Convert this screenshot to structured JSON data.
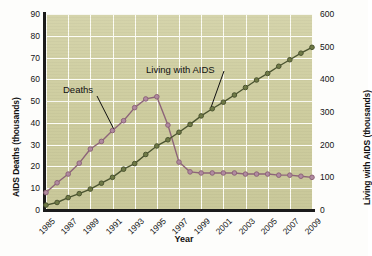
{
  "chart_data": {
    "type": "line",
    "title": "",
    "xlabel": "Year",
    "ylabel_left": "AIDS Deaths (thousands)",
    "ylabel_right": "Living with AIDS (thousands)",
    "x": [
      1985,
      1986,
      1987,
      1988,
      1989,
      1990,
      1991,
      1992,
      1993,
      1994,
      1995,
      1996,
      1997,
      1998,
      1999,
      2000,
      2001,
      2002,
      2003,
      2004,
      2005,
      2006,
      2007,
      2008,
      2009
    ],
    "xtick_labels": [
      "1985",
      "1987",
      "1989",
      "1991",
      "1993",
      "1995",
      "1997",
      "1999",
      "2001",
      "2003",
      "2005",
      "2007",
      "2009"
    ],
    "xtick_values": [
      1985,
      1987,
      1989,
      1991,
      1993,
      1995,
      1997,
      1999,
      2001,
      2003,
      2005,
      2007,
      2009
    ],
    "ylim_left": [
      0,
      90
    ],
    "ytick_labels_left": [
      "0",
      "10",
      "20",
      "30",
      "40",
      "50",
      "60",
      "70",
      "80",
      "90"
    ],
    "ytick_values_left": [
      0,
      10,
      20,
      30,
      40,
      50,
      60,
      70,
      80,
      90
    ],
    "ylim_right": [
      0,
      600
    ],
    "ytick_labels_right": [
      "0",
      "100",
      "200",
      "300",
      "400",
      "500",
      "600"
    ],
    "ytick_values_right": [
      0,
      100,
      200,
      300,
      400,
      500,
      600
    ],
    "grid": true,
    "legend_position": "inline-annotations",
    "series": [
      {
        "name": "Deaths",
        "axis": "left",
        "color": "#8d6479",
        "marker_face": "#b08aa0",
        "values": [
          8,
          12.5,
          16.5,
          21.5,
          28,
          31.5,
          36.5,
          41,
          47,
          51,
          52,
          39,
          22,
          17.5,
          17,
          17,
          17,
          17,
          16.5,
          16.5,
          16.5,
          16,
          16,
          15.5,
          15
        ]
      },
      {
        "name": "Living with AIDS",
        "axis": "right",
        "color": "#4b5430",
        "marker_face": "#6f7a46",
        "values": [
          15,
          23,
          38,
          50,
          64,
          82,
          100,
          125,
          142,
          170,
          196,
          215,
          238,
          262,
          288,
          310,
          330,
          352,
          375,
          398,
          418,
          440,
          460,
          480,
          498
        ]
      }
    ],
    "annotations": [
      {
        "text": "Deaths",
        "series": "Deaths"
      },
      {
        "text": "Living with AIDS",
        "series": "Living with AIDS"
      }
    ]
  },
  "colors": {
    "plot_background": "#cfcfa2",
    "gridline": "#fdfdf6",
    "axis": "#1b1b1b",
    "deaths_line": "#8d6479",
    "living_line": "#4b5430",
    "page_background": "#fdfdfb"
  }
}
